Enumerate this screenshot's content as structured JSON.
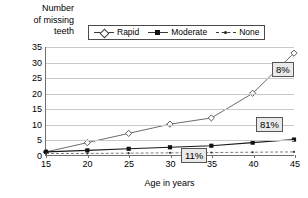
{
  "chart_data": {
    "type": "line",
    "title": "",
    "ylabel": "Number of missing teeth",
    "xlabel": "Age in years",
    "x": [
      15,
      20,
      25,
      30,
      35,
      40,
      45
    ],
    "xticks": [
      "15",
      "20",
      "25",
      "30",
      "35",
      "40",
      "45"
    ],
    "yticks": [
      "0",
      "5",
      "10",
      "15",
      "20",
      "25",
      "30",
      "35"
    ],
    "ylim": [
      0,
      35
    ],
    "xlim": [
      15,
      45
    ],
    "grid": true,
    "legend_position": "top-center",
    "series": [
      {
        "name": "Rapid",
        "marker": "open-diamond",
        "values": [
          1,
          4,
          7,
          10,
          12,
          20,
          33
        ]
      },
      {
        "name": "Moderate",
        "marker": "filled-square",
        "values": [
          1,
          1.5,
          2,
          2.5,
          3,
          4,
          5
        ]
      },
      {
        "name": "None",
        "marker": "small-dot",
        "values": [
          0.5,
          0.5,
          0.6,
          0.7,
          0.8,
          0.9,
          1
        ]
      }
    ],
    "annotations": [
      {
        "text": "8%",
        "series": "Rapid",
        "at_x": 45
      },
      {
        "text": "81%",
        "series": "Moderate",
        "at_x": 45
      },
      {
        "text": "11%",
        "series": "None",
        "at_x": 35
      }
    ]
  },
  "ylabel_lines": [
    "Number",
    "of missing",
    "teeth"
  ],
  "legend": {
    "items": [
      {
        "label": "Rapid"
      },
      {
        "label": "Moderate"
      },
      {
        "label": "None"
      }
    ]
  },
  "colors": {
    "rapid_line": "#6b6b6b",
    "moderate_line": "#1a1a1a",
    "none_line": "#7a7a7a",
    "grid": "#c9c9c9",
    "axis": "#6f6f6f",
    "callout_fill": "#e9e9e9"
  }
}
